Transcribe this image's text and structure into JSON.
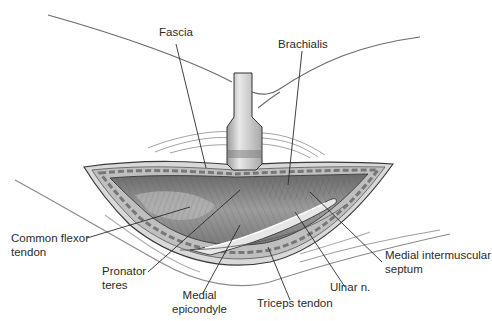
{
  "figure": {
    "type": "surgical anatomy illustration",
    "view": "medial approach to elbow, exposure with retractor",
    "labels": [
      {
        "id": "fascia",
        "lines": [
          "Fascia"
        ]
      },
      {
        "id": "brachialis",
        "lines": [
          "Brachialis"
        ]
      },
      {
        "id": "common-flexor-tendon",
        "lines": [
          "Common flexor",
          "tendon"
        ]
      },
      {
        "id": "pronator-teres",
        "lines": [
          "Pronator",
          "teres"
        ]
      },
      {
        "id": "medial-epicondyle",
        "lines": [
          "Medial",
          "epicondyle"
        ]
      },
      {
        "id": "triceps-tendon",
        "lines": [
          "Triceps tendon"
        ]
      },
      {
        "id": "ulnar-nerve",
        "lines": [
          "Ulnar n."
        ]
      },
      {
        "id": "medial-intermuscular-septum",
        "lines": [
          "Medial intermuscular",
          "septum"
        ]
      }
    ]
  },
  "colors": {
    "background": "#ffffff",
    "outline": "#3a3a3a",
    "muscle": "#8a8a8a",
    "retractor": "#c8c8c8",
    "text": "#2a2a2a"
  }
}
